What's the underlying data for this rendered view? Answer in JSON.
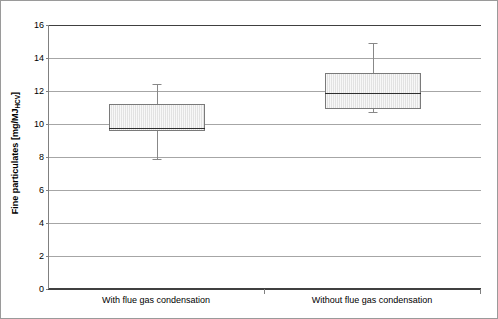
{
  "chart_data": {
    "type": "box",
    "title": "",
    "xlabel": "",
    "ylabel_text": "Fine particulates [mg/MJ",
    "ylabel_sub": "HCV",
    "ylabel_tail": "]",
    "ylabel_full": "Fine particulates [mg/MJHCV]",
    "categories": [
      "With flue gas condensation",
      "Without flue gas condensation"
    ],
    "ylim": [
      0,
      16
    ],
    "yticks": [
      0,
      2,
      4,
      6,
      8,
      10,
      12,
      14,
      16
    ],
    "ytick_labels": [
      "0",
      "2",
      "4",
      "6",
      "8",
      "10",
      "12",
      "14",
      "16"
    ],
    "grid": true,
    "legend": "none",
    "boxes": [
      {
        "category": "With flue gas condensation",
        "whisker_low": 7.9,
        "q1": 9.6,
        "median": 9.75,
        "q3": 11.2,
        "whisker_high": 12.4
      },
      {
        "category": "Without flue gas condensation",
        "whisker_low": 10.7,
        "q1": 10.9,
        "median": 11.9,
        "q3": 13.1,
        "whisker_high": 14.9
      }
    ],
    "colors": {
      "box_fill": "#e2e2e2",
      "box_border": "#7a7a7a",
      "median": "#2e2e2e",
      "whisker": "#888888",
      "gridline": "#a6a6a6",
      "axis": "#404040",
      "frame": "#9a9a9a",
      "text": "#000000"
    }
  }
}
